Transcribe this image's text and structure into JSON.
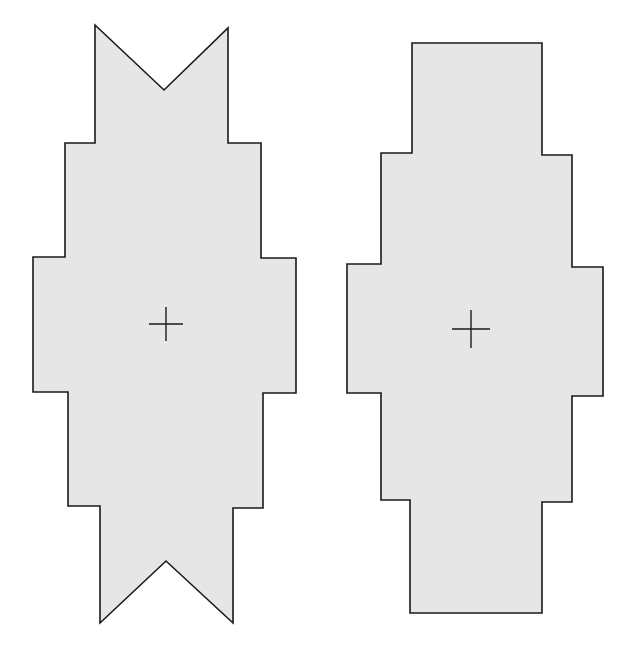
{
  "figure": {
    "background": "#ffffff",
    "fill_color": "#e6e6e6",
    "stroke_color": "#1a1a1a",
    "shapes": [
      {
        "id": "left",
        "description": "stepped cross-like polygon with V-notched top and bottom ends",
        "points": [
          [
            95,
            25
          ],
          [
            164,
            90
          ],
          [
            228,
            28
          ],
          [
            228,
            143
          ],
          [
            261,
            143
          ],
          [
            261,
            258
          ],
          [
            296,
            258
          ],
          [
            296,
            393
          ],
          [
            263,
            393
          ],
          [
            263,
            508
          ],
          [
            233,
            508
          ],
          [
            233,
            623
          ],
          [
            166,
            561
          ],
          [
            100,
            623
          ],
          [
            100,
            506
          ],
          [
            68,
            506
          ],
          [
            68,
            392
          ],
          [
            33,
            392
          ],
          [
            33,
            257
          ],
          [
            65,
            257
          ],
          [
            65,
            143
          ],
          [
            95,
            143
          ]
        ],
        "center_mark": {
          "x": 166,
          "y": 324,
          "size": 17
        }
      },
      {
        "id": "right",
        "description": "stepped cross-like polygon with flat rectangular top and bottom ends",
        "points": [
          [
            412,
            43
          ],
          [
            542,
            43
          ],
          [
            542,
            155
          ],
          [
            572,
            155
          ],
          [
            572,
            267
          ],
          [
            603,
            267
          ],
          [
            603,
            396
          ],
          [
            572,
            396
          ],
          [
            572,
            502
          ],
          [
            542,
            502
          ],
          [
            542,
            613
          ],
          [
            410,
            613
          ],
          [
            410,
            500
          ],
          [
            381,
            500
          ],
          [
            381,
            393
          ],
          [
            347,
            393
          ],
          [
            347,
            264
          ],
          [
            381,
            264
          ],
          [
            381,
            153
          ],
          [
            412,
            153
          ]
        ],
        "center_mark": {
          "x": 471,
          "y": 329,
          "size": 19
        }
      }
    ]
  }
}
